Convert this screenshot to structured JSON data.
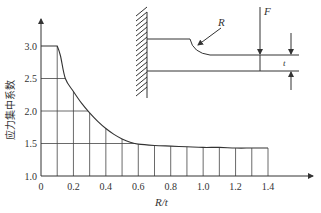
{
  "chart_data": {
    "type": "line",
    "title": "",
    "xlabel": "R/t",
    "ylabel": "应力集中系数",
    "xlim": [
      0,
      1.4
    ],
    "ylim": [
      1.0,
      3.0
    ],
    "x_ticks": [
      "0",
      "0.2",
      "0.4",
      "0.6",
      "0.8",
      "1.0",
      "1.2",
      "1.4"
    ],
    "x_tick_values": [
      0,
      0.2,
      0.4,
      0.6,
      0.8,
      1.0,
      1.2,
      1.4
    ],
    "y_ticks": [
      "1.0",
      "1.5",
      "2.0",
      "2.5",
      "3.0"
    ],
    "y_tick_values": [
      1.0,
      1.5,
      2.0,
      2.5,
      3.0
    ],
    "grid_x": [
      0.1,
      0.2,
      0.3,
      0.4,
      0.5,
      0.6,
      0.7,
      0.8,
      0.9,
      1.0,
      1.1,
      1.2,
      1.3,
      1.4
    ],
    "grid_y": [
      1.5,
      2.0,
      2.5
    ],
    "series": [
      {
        "name": "应力集中系数",
        "x": [
          0,
          0.1,
          0.12,
          0.15,
          0.2,
          0.25,
          0.3,
          0.35,
          0.4,
          0.45,
          0.5,
          0.55,
          0.6,
          0.7,
          0.8,
          0.9,
          1.0,
          1.1,
          1.2,
          1.3,
          1.4
        ],
        "y": [
          3.0,
          3.0,
          2.85,
          2.5,
          2.3,
          2.12,
          1.97,
          1.84,
          1.73,
          1.64,
          1.57,
          1.52,
          1.49,
          1.47,
          1.46,
          1.45,
          1.44,
          1.44,
          1.43,
          1.43,
          1.43
        ]
      }
    ],
    "legend": "none"
  },
  "diagram": {
    "label_R": "R",
    "label_F": "F",
    "label_t": "t"
  }
}
